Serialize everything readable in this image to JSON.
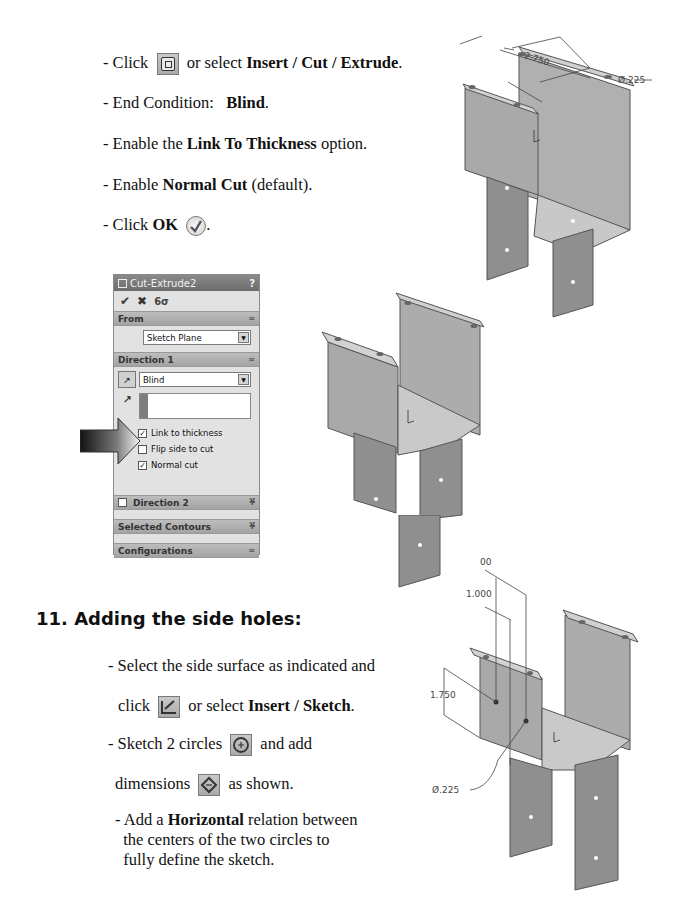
{
  "step10": {
    "lines": {
      "l1_pre": "- Click",
      "l1_mid": "or select",
      "l1_bold": "Insert / Cut / Extrude",
      "l1_post": ".",
      "l2_pre": "- End Condition:",
      "l2_bold": "Blind",
      "l2_post": ".",
      "l3_pre": "- Enable the",
      "l3_bold": "Link To Thickness",
      "l3_post": "option.",
      "l4_pre": "- Enable",
      "l4_bold": "Normal Cut",
      "l4_post": "(default).",
      "l5_pre": "- Click",
      "l5_bold": "OK",
      "l5_post": "."
    },
    "icons": {
      "extrude_cut": "extruded-cut-icon",
      "ok": "ok-check-icon"
    }
  },
  "property_manager": {
    "title": "Cut-Extrude2",
    "help": "?",
    "actions": {
      "ok": "✔",
      "cancel": "✖",
      "detail": "6σ"
    },
    "sections": {
      "from": {
        "label": "From",
        "chevron": "≈",
        "select_value": "Sketch Plane"
      },
      "direction1": {
        "label": "Direction 1",
        "chevron": "≈",
        "end_condition": "Blind",
        "options": [
          {
            "label": "Link to thickness",
            "checked": true
          },
          {
            "label": "Flip side to cut",
            "checked": false
          },
          {
            "label": "Normal cut",
            "checked": true
          }
        ]
      },
      "direction2": {
        "label": "Direction 2",
        "chevron": "¥",
        "checked": false
      },
      "selected_contours": {
        "label": "Selected Contours",
        "chevron": "¥"
      },
      "configurations": {
        "label": "Configurations",
        "chevron": "≈"
      }
    }
  },
  "model_top": {
    "dim_spacing": "2.750",
    "dim_diameter": "Ø.225"
  },
  "step11": {
    "heading": "11. Adding the side holes:",
    "lines": {
      "l1": "- Select the side surface as indicated and",
      "l2_pre": "click",
      "l2_mid": "or select",
      "l2_bold": "Insert / Sketch",
      "l2_post": ".",
      "l3_pre": "- Sketch 2 circles",
      "l3_post": "and add",
      "l4_pre": "dimensions",
      "l4_post": "as shown.",
      "l5_pre": "- Add a",
      "l5_bold": "Horizontal",
      "l5_post": "relation between",
      "l6": "the centers of the two circles to",
      "l7": "fully define the sketch."
    }
  },
  "model_bottom": {
    "dim_top": "00",
    "dim_horizontal": "1.000",
    "dim_vertical": "1.750",
    "dim_diameter": "Ø.225"
  }
}
